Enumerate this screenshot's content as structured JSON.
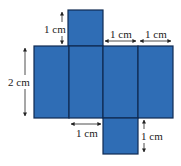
{
  "diagram": {
    "type": "cuboid-net",
    "colors": {
      "face": "#2f6db5",
      "edge": "#0f2a52",
      "annotation": "#222222"
    },
    "faces": [
      {
        "name": "top-face",
        "x": 68,
        "y": 10,
        "w": 35,
        "h": 36
      },
      {
        "name": "face-1",
        "x": 34,
        "y": 46,
        "w": 35,
        "h": 72
      },
      {
        "name": "face-2",
        "x": 69,
        "y": 46,
        "w": 34,
        "h": 72
      },
      {
        "name": "face-3",
        "x": 103,
        "y": 46,
        "w": 35,
        "h": 72
      },
      {
        "name": "face-4",
        "x": 138,
        "y": 46,
        "w": 35,
        "h": 72
      },
      {
        "name": "bottom-face",
        "x": 103,
        "y": 118,
        "w": 35,
        "h": 36
      }
    ],
    "labels": {
      "top_square_height": "1 cm",
      "face3_width": "1 cm",
      "face4_width": "1 cm",
      "height": "2 cm",
      "face2_width": "1 cm",
      "bottom_square_height": "1 cm"
    }
  }
}
